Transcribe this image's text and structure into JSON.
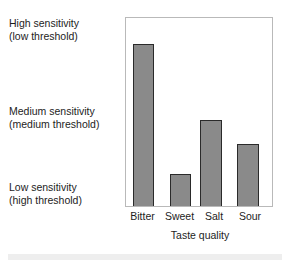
{
  "figure": {
    "background_color": "#ffffff",
    "bottom_band_color": "#eeeeee"
  },
  "axis_labels": {
    "y": [
      {
        "line1": "High sensitivity",
        "line2": "(low threshold)"
      },
      {
        "line1": "Medium sensitivity",
        "line2": "(medium threshold)"
      },
      {
        "line1": "Low sensitivity",
        "line2": "(high threshold)"
      }
    ],
    "x_title": "Taste quality"
  },
  "chart_data": {
    "type": "bar",
    "title": "",
    "subtitle": "",
    "xlabel": "Taste quality",
    "ylabel": "",
    "categories": [
      "Bitter",
      "Sweet",
      "Salt",
      "Sour"
    ],
    "values": [
      86,
      17,
      46,
      33
    ],
    "ylim": [
      0,
      100
    ],
    "ytick_labels": [
      "Low sensitivity (high threshold)",
      "Medium sensitivity (medium threshold)",
      "High sensitivity (low threshold)"
    ],
    "ytick_values": [
      14,
      52,
      98
    ],
    "grid": false,
    "legend": false,
    "legend_position": "none",
    "bar_fill_color": "#8a8a8a",
    "bar_edge_color": "#2a2a2a",
    "frame_color": "#b9b9b9",
    "units": "relative sensitivity (percent of plot height)",
    "annotations": []
  }
}
